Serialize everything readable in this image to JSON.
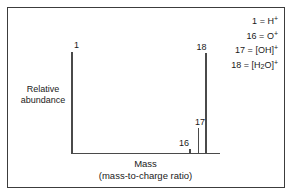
{
  "figure": {
    "border_color": "#3c3c3c",
    "background": "#ffffff",
    "line_color": "#4a4a4a"
  },
  "axes": {
    "y_label_line1": "Relative",
    "y_label_line2": "abundance",
    "x_label": "Mass",
    "x_sublabel": "(mass-to-charge ratio)"
  },
  "legend": {
    "rows": [
      {
        "mass": "1",
        "eq": "=",
        "species": "H",
        "charge": "+",
        "sub": ""
      },
      {
        "mass": "16",
        "eq": "=",
        "species": "O",
        "charge": "+",
        "sub": ""
      },
      {
        "mass": "17",
        "eq": "=",
        "species": "[OH]",
        "charge": "+",
        "sub": ""
      },
      {
        "mass": "18",
        "eq": "=",
        "species": "[H",
        "charge": "+",
        "sub": "2",
        "species_tail": "O]"
      }
    ],
    "line1": "1 = H+",
    "line2": "16 = O+",
    "line3": "17 = [OH]+",
    "line4": "18 = [H2O]+"
  },
  "peak_labels": {
    "p1": "1",
    "p16": "16",
    "p17": "17",
    "p18": "18"
  },
  "chart_data": {
    "type": "bar",
    "title": "",
    "xlabel": "Mass (mass-to-charge ratio)",
    "ylabel": "Relative abundance",
    "categories": [
      "1",
      "16",
      "17",
      "18"
    ],
    "values": [
      100,
      4,
      25,
      99
    ],
    "annotations": [
      "1 = H+",
      "16 = O+",
      "17 = [OH]+",
      "18 = [H2O]+"
    ],
    "xlim": [
      0,
      20
    ],
    "ylim": [
      0,
      100
    ],
    "grid": false,
    "legend_position": "top-right",
    "bar_width_px": 1.6
  }
}
